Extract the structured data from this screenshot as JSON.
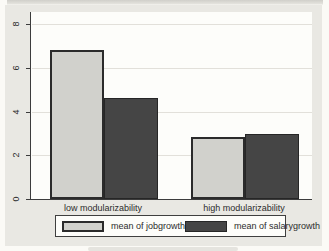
{
  "figure": {
    "graph_region_bg": "#e9e8e3",
    "plot_region_bg": "#fdfdfa",
    "axis_color": "#3c3c3c",
    "gridline_color": "#e2e0da"
  },
  "chart_data": {
    "type": "bar",
    "title": "",
    "xlabel": "",
    "ylabel": "",
    "categories": [
      "low modularizability",
      "high modularizability"
    ],
    "series": [
      {
        "name": "mean of jobgrowth",
        "values": [
          6.8,
          2.85
        ],
        "color": "#d1d1cc",
        "border": "#2b2b2b"
      },
      {
        "name": "mean of salarygrowth",
        "values": [
          4.6,
          2.95
        ],
        "color": "#454545",
        "border": "#262626"
      }
    ],
    "ylim": [
      0,
      8
    ],
    "yticks": [
      0,
      2,
      4,
      6,
      8
    ],
    "grid": true,
    "legend_position": "bottom"
  }
}
